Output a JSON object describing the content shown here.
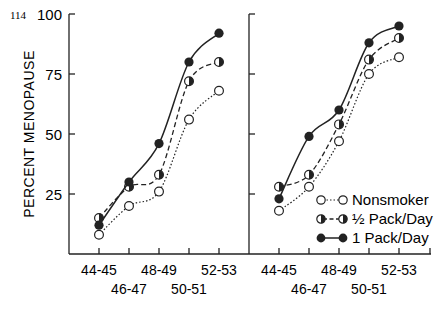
{
  "page_number": "114",
  "chart_data": [
    {
      "type": "line",
      "panel": "left",
      "title": "",
      "xlabel": "",
      "ylabel": "PERCENT MENOPAUSE",
      "categories": [
        "44-45",
        "46-47",
        "48-49",
        "50-51",
        "52-53"
      ],
      "yticks": [
        25,
        50,
        75,
        100
      ],
      "ylim": [
        0,
        100
      ],
      "grid": false,
      "series": [
        {
          "name": "Nonsmoker",
          "style": "dotted",
          "marker": "open-circle",
          "values": [
            8,
            20,
            26,
            56,
            68
          ]
        },
        {
          "name": "½ Pack/Day",
          "style": "dashed",
          "marker": "half-filled-circle",
          "values": [
            15,
            28,
            33,
            72,
            80
          ]
        },
        {
          "name": "1 Pack/Day",
          "style": "solid",
          "marker": "filled-circle",
          "values": [
            12,
            30,
            46,
            80,
            92
          ]
        }
      ]
    },
    {
      "type": "line",
      "panel": "right",
      "title": "",
      "xlabel": "",
      "ylabel": "",
      "categories": [
        "44-45",
        "46-47",
        "48-49",
        "50-51",
        "52-53"
      ],
      "yticks": [
        25,
        50,
        75,
        100
      ],
      "ylim": [
        0,
        100
      ],
      "grid": false,
      "legend_position": "lower right",
      "series": [
        {
          "name": "Nonsmoker",
          "style": "dotted",
          "marker": "open-circle",
          "values": [
            18,
            28,
            47,
            75,
            82
          ]
        },
        {
          "name": "½ Pack/Day",
          "style": "dashed",
          "marker": "half-filled-circle",
          "values": [
            28,
            33,
            54,
            81,
            90
          ]
        },
        {
          "name": "1 Pack/Day",
          "style": "solid",
          "marker": "filled-circle",
          "values": [
            23,
            49,
            60,
            88,
            95
          ]
        }
      ]
    }
  ],
  "axis": {
    "ylabel": "PERCENT MENOPAUSE",
    "yticks": [
      "100",
      "75",
      "50",
      "25"
    ],
    "xticks_upper": [
      "44-45",
      "48-49",
      "52-53"
    ],
    "xticks_lower": [
      "46-47",
      "50-51"
    ]
  },
  "legend": {
    "items": [
      {
        "label": "Nonsmoker"
      },
      {
        "label": "½ Pack/Day"
      },
      {
        "label": "1 Pack/Day"
      }
    ]
  }
}
